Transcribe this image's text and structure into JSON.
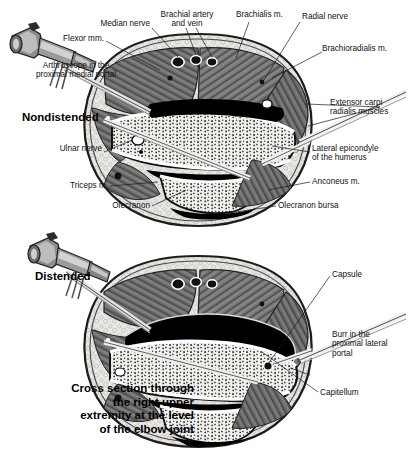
{
  "figure": {
    "caption": "Cross section through\nthe right upper\nextremity at the level\nof the elbow joint",
    "panels": [
      {
        "id": "nondistended",
        "state_label": "Nondistended",
        "instrument": "arthroscope",
        "labels": [
          {
            "name": "median-nerve",
            "text": "Median nerve"
          },
          {
            "name": "brachial-artery-vein",
            "text": "Brachial artery\nand vein"
          },
          {
            "name": "brachialis-muscle",
            "text": "Brachialis m."
          },
          {
            "name": "radial-nerve",
            "text": "Radial nerve"
          },
          {
            "name": "flexor-muscles",
            "text": "Flexor mm."
          },
          {
            "name": "brachioradialis-muscle",
            "text": "Brachioradialis m."
          },
          {
            "name": "arthroscope-portal",
            "text": "Arthroscope in the\nproximal medial portal"
          },
          {
            "name": "extensor-carpi-radialis",
            "text": "Extensor carpi\nradialis muscles"
          },
          {
            "name": "ulnar-nerve",
            "text": "Ulnar nerve"
          },
          {
            "name": "lateral-epicondyle",
            "text": "Lateral epicondyle\nof the humerus"
          },
          {
            "name": "triceps-muscle",
            "text": "Triceps m."
          },
          {
            "name": "anconeus-muscle",
            "text": "Anconeus m."
          },
          {
            "name": "olecranon",
            "text": "Olecranon"
          },
          {
            "name": "olecranon-bursa",
            "text": "Olecranon bursa"
          }
        ]
      },
      {
        "id": "distended",
        "state_label": "Distended",
        "instrument": "arthroscope",
        "labels": [
          {
            "name": "capsule",
            "text": "Capsule"
          },
          {
            "name": "burr-portal",
            "text": "Burr in the\nproximal lateral\nportal"
          },
          {
            "name": "capitellum",
            "text": "Capitellum"
          }
        ]
      }
    ]
  }
}
